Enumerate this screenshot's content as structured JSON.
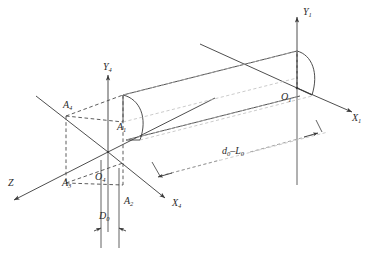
{
  "figure": {
    "type": "engineering-line-diagram",
    "background_color": "#ffffff",
    "line_color": "#3a3a3a",
    "dashed_color": "#4a4a4a",
    "faint_color": "#b9b9b9"
  },
  "labels": {
    "y1": {
      "text": "Y",
      "sub": "1"
    },
    "x1": {
      "text": "X",
      "sub": "1"
    },
    "o1": {
      "text": "O",
      "sub": "1"
    },
    "y4": {
      "text": "Y",
      "sub": "4"
    },
    "x4": {
      "text": "X",
      "sub": "4"
    },
    "o4": {
      "text": "O",
      "sub": "4"
    },
    "z": {
      "text": "Z",
      "sub": ""
    },
    "a1": {
      "text": "A",
      "sub": "1"
    },
    "a2": {
      "text": "A",
      "sub": "2"
    },
    "a3": {
      "text": "A",
      "sub": "3"
    },
    "a4": {
      "text": "A",
      "sub": "4"
    },
    "d0": {
      "text": "D",
      "sub": "0"
    },
    "d0_minus_l0": {
      "prefix": "d",
      "sub1": "0",
      "mid": "–",
      "suffix": "L",
      "sub2": "0"
    }
  },
  "geometry": {
    "frame1_origin": [
      297,
      88
    ],
    "frame4_origin": [
      108,
      152
    ],
    "beam_left_top": [
      123,
      95
    ],
    "beam_right_top": [
      297,
      51
    ],
    "dimension_d0_px": 18,
    "dimension_length_label_pos": [
      224,
      152
    ]
  }
}
